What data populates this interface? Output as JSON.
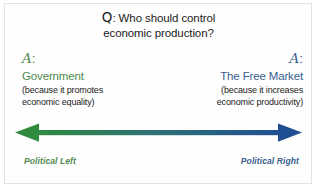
{
  "diagram": {
    "background_color": "#ffffff",
    "frame_color": "#e2e3e4",
    "question": {
      "prefix": "Q",
      "colon": ": ",
      "line1": "Who should control",
      "line2": "economic production?"
    },
    "left": {
      "letter": "A",
      "colon": ":",
      "title": "Government",
      "note_line1": "(because it promotes",
      "note_line2": "economic equality)",
      "pole_label": "Political Left",
      "color": "#4e8a4c"
    },
    "right": {
      "letter": "A",
      "colon": ":",
      "title": "The Free Market",
      "note_line1": "(because it increases",
      "note_line2": "economic productivity)",
      "pole_label": "Political Right",
      "color": "#3a5f8f"
    },
    "arrow": {
      "type": "double-headed-horizontal",
      "gradient_start_color": "#2e8b3d",
      "gradient_mid_color": "#2e6f77",
      "gradient_end_color": "#1f4f92",
      "left_head_color": "#2f8b3e",
      "right_head_color": "#1f4f92"
    }
  }
}
